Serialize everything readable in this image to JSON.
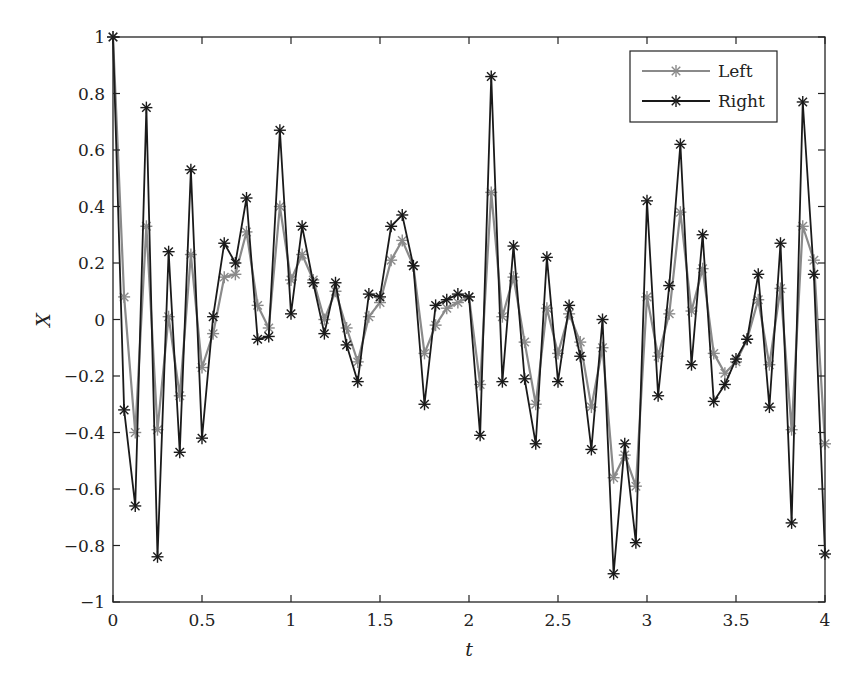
{
  "chart_data": {
    "type": "line",
    "title": "",
    "xlabel": "t",
    "ylabel": "X",
    "xlim": [
      0,
      4
    ],
    "ylim": [
      -1,
      1
    ],
    "grid": false,
    "legend_position": "upper right",
    "x_ticks": [
      "0",
      "0.5",
      "1",
      "1.5",
      "2",
      "2.5",
      "3",
      "3.5",
      "4"
    ],
    "y_ticks": [
      "-1",
      "-0.8",
      "-0.6",
      "-0.4",
      "-0.2",
      "0",
      "0.2",
      "0.4",
      "0.6",
      "0.8",
      "1"
    ],
    "x_step": 0.0625,
    "series": [
      {
        "name": "Left",
        "color": "#8a8a8a",
        "marker": "asterisk",
        "values": [
          1.0,
          0.08,
          -0.4,
          0.33,
          -0.39,
          0.01,
          -0.27,
          0.23,
          -0.17,
          -0.05,
          0.15,
          0.16,
          0.31,
          0.05,
          -0.03,
          0.4,
          0.14,
          0.23,
          0.14,
          0.0,
          0.1,
          -0.03,
          -0.15,
          0.01,
          0.06,
          0.21,
          0.28,
          0.19,
          -0.12,
          -0.02,
          0.04,
          0.06,
          0.08,
          -0.23,
          0.45,
          0.01,
          0.15,
          -0.08,
          -0.3,
          0.04,
          -0.12,
          0.02,
          -0.08,
          -0.31,
          -0.1,
          -0.56,
          -0.48,
          -0.59,
          0.08,
          -0.13,
          0.02,
          0.38,
          0.03,
          0.18,
          -0.12,
          -0.19,
          -0.15,
          -0.07,
          0.07,
          -0.16,
          0.11,
          -0.39,
          0.33,
          0.21,
          -0.44
        ]
      },
      {
        "name": "Right",
        "color": "#1a1a1a",
        "marker": "asterisk",
        "values": [
          1.0,
          -0.32,
          -0.66,
          0.75,
          -0.84,
          0.24,
          -0.47,
          0.53,
          -0.42,
          0.01,
          0.27,
          0.2,
          0.43,
          -0.07,
          -0.06,
          0.67,
          0.02,
          0.33,
          0.13,
          -0.05,
          0.13,
          -0.09,
          -0.22,
          0.09,
          0.08,
          0.33,
          0.37,
          0.19,
          -0.3,
          0.05,
          0.07,
          0.09,
          0.08,
          -0.41,
          0.86,
          -0.22,
          0.26,
          -0.21,
          -0.44,
          0.22,
          -0.22,
          0.05,
          -0.13,
          -0.46,
          0.0,
          -0.9,
          -0.44,
          -0.79,
          0.42,
          -0.27,
          0.12,
          0.62,
          -0.16,
          0.3,
          -0.29,
          -0.23,
          -0.14,
          -0.07,
          0.16,
          -0.31,
          0.27,
          -0.72,
          0.77,
          0.16,
          -0.83
        ]
      }
    ]
  },
  "legend": {
    "items": [
      {
        "label": "Left",
        "color": "#8a8a8a"
      },
      {
        "label": "Right",
        "color": "#1a1a1a"
      }
    ]
  },
  "axes": {
    "xlabel": "t",
    "ylabel": "X"
  }
}
